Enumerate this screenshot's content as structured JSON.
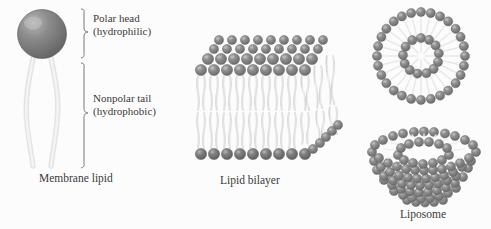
{
  "figure": {
    "background_color": "#fcfcfc",
    "head_color": "#808080",
    "head_highlight_color": "#a8a8a8",
    "head_outline_color": "#606060",
    "tail_color": "#e2e2e2",
    "tail_shade_color": "#cfcfcf",
    "text_color": "#3a3a3a"
  },
  "panels": {
    "membrane_lipid": {
      "caption": "Membrane lipid",
      "head_label_line1": "Polar head",
      "head_label_line2": "(hydrophilic)",
      "tail_label_line1": "Nonpolar tail",
      "tail_label_line2": "(hydrophobic)",
      "head_count": 1,
      "tail_count": 2,
      "brace_head": "head-brace",
      "brace_tail": "tail-brace"
    },
    "lipid_bilayer": {
      "caption": "Lipid bilayer",
      "leaflets": 2,
      "heads_per_row": 8,
      "perspective_rows": 4,
      "orientation": "3d-slab"
    },
    "vesicle": {
      "caption": "",
      "outer_ring_beads": 28,
      "inner_ring_beads": 13,
      "orientation": "cross-section"
    },
    "liposome": {
      "caption": "Liposome",
      "orientation": "3d-cutaway",
      "rim_rings": 2
    }
  }
}
